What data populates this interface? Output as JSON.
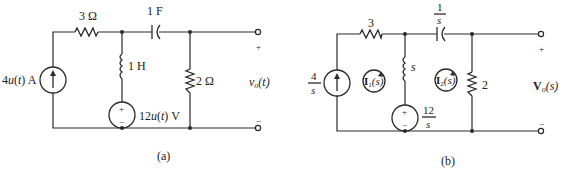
{
  "figure_a": {
    "caption": "(a)",
    "current_source": {
      "value_prefix": "4",
      "func": "u",
      "arg_open": "(",
      "arg": "t",
      "arg_close": ")",
      "unit": " A"
    },
    "resistor_series": {
      "label": "3 Ω"
    },
    "inductor": {
      "label": "1 H"
    },
    "capacitor": {
      "label": "1 F"
    },
    "voltage_source": {
      "value_prefix": "12",
      "func": "u",
      "arg_open": "(",
      "arg": "t",
      "arg_close": ")",
      "unit": " V",
      "plus": "+",
      "minus": "−"
    },
    "resistor_shunt": {
      "label": "2 Ω"
    },
    "output": {
      "name": "v",
      "sub": "o",
      "arg": "(t)",
      "plus": "+",
      "minus": "−"
    }
  },
  "figure_b": {
    "caption": "(b)",
    "current_source": {
      "num": "4",
      "den": "s"
    },
    "resistor_series": {
      "label": "3"
    },
    "inductor": {
      "label": "s"
    },
    "capacitor": {
      "num": "1",
      "den": "s"
    },
    "voltage_source": {
      "num": "12",
      "den": "s",
      "plus": "+",
      "minus": "−"
    },
    "resistor_shunt": {
      "label": "2"
    },
    "mesh1": {
      "name": "I",
      "sub": "1",
      "arg": "(s)"
    },
    "mesh2": {
      "name": "I",
      "sub": "2",
      "arg": "(s)"
    },
    "output": {
      "name": "V",
      "sub": "o",
      "arg": "(s)",
      "plus": "+",
      "minus": "−"
    }
  }
}
